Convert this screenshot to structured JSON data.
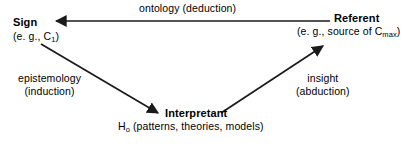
{
  "diagram": {
    "type": "semiotic-triangle",
    "background": "#ffffff",
    "line_color": "#1a1a1a",
    "text_color": "#000000",
    "nodes": [
      {
        "id": "sign",
        "title": "Sign",
        "subtitle_prefix": "(e. g., C",
        "subtitle_sub": "1",
        "subtitle_suffix": ")",
        "position": "top-left"
      },
      {
        "id": "referent",
        "title": "Referent",
        "subtitle_prefix": "(e. g., source of C",
        "subtitle_sub": "max",
        "subtitle_suffix": ")",
        "position": "top-right"
      },
      {
        "id": "interpretant",
        "title": "Interpretant",
        "subtitle_prefix": "H",
        "subtitle_sub": "o",
        "subtitle_suffix": " (patterns, theories, models)",
        "position": "bottom-center"
      }
    ],
    "edges": [
      {
        "id": "ontology",
        "from": "referent",
        "to": "sign",
        "label_line1": "ontology (deduction)",
        "label_line2": "",
        "direction": "horizontal-left"
      },
      {
        "id": "epistemology",
        "from": "sign",
        "to": "interpretant",
        "label_line1": "epistemology",
        "label_line2": "(induction)",
        "direction": "diagonal-down-right"
      },
      {
        "id": "insight",
        "from": "interpretant",
        "to": "referent",
        "label_line1": "insight",
        "label_line2": "(abduction)",
        "direction": "diagonal-up-right"
      }
    ]
  }
}
